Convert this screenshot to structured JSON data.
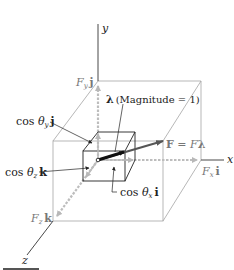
{
  "diagram": {
    "type": "3d-vector-decomposition",
    "axes": {
      "x_label": "x",
      "y_label": "y",
      "z_label": "z"
    },
    "unit_vector": {
      "symbol": "λ",
      "note": "(Magnitude = 1)"
    },
    "force": {
      "lhs": "F",
      "eq": " = ",
      "rhs_scalar": "F",
      "rhs_vec": "λ"
    },
    "components": {
      "Fx": {
        "scalar": "F",
        "sub": "x",
        "unit": "i"
      },
      "Fy": {
        "scalar": "F",
        "sub": "y",
        "unit": "j"
      },
      "Fz": {
        "scalar": "F",
        "sub": "z",
        "unit": "k"
      }
    },
    "direction_cosines": {
      "x": {
        "prefix": "cos ",
        "theta": "θ",
        "sub": "x",
        "unit": "i"
      },
      "y": {
        "prefix": "cos ",
        "theta": "θ",
        "sub": "y",
        "unit": "j"
      },
      "z": {
        "prefix": "cos ",
        "theta": "θ",
        "sub": "z",
        "unit": "k"
      }
    },
    "colors": {
      "axis": "#333333",
      "box": "#9a9a9a",
      "component_arrow": "#b8b8b8",
      "force_arrow": "#555555",
      "unit_arrow": "#111111",
      "label": "#222222",
      "label_gray": "#777777"
    }
  }
}
